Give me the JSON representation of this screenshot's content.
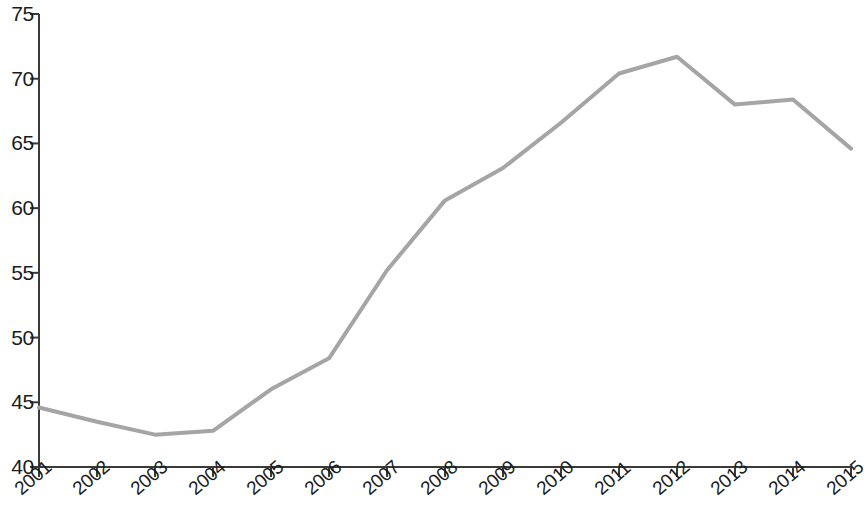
{
  "chart_data": {
    "type": "line",
    "title": "",
    "subtitle": "",
    "xlabel": "",
    "ylabel": "",
    "categories": [
      "2001",
      "2002",
      "2003",
      "2004",
      "2005",
      "2006",
      "2007",
      "2008",
      "2009",
      "2010",
      "2011",
      "2012",
      "2013",
      "2014",
      "2015"
    ],
    "values": [
      44.6,
      43.5,
      42.5,
      42.8,
      46.0,
      48.4,
      55.2,
      60.6,
      63.1,
      66.6,
      70.4,
      71.7,
      68.0,
      68.4,
      64.6
    ],
    "series": [
      {
        "name": "",
        "values": [
          44.6,
          43.5,
          42.5,
          42.8,
          46.0,
          48.4,
          55.2,
          60.6,
          63.1,
          66.6,
          70.4,
          71.7,
          68.0,
          68.4,
          64.6
        ],
        "color": "#a5a5a5"
      }
    ],
    "ylim": [
      40,
      75
    ],
    "yticks": [
      40,
      45,
      50,
      55,
      60,
      65,
      70,
      75
    ],
    "ytick_labels": [
      "40",
      "45",
      "50",
      "55",
      "60",
      "65",
      "70",
      "75"
    ],
    "xtick_labels": [
      "2001",
      "2002",
      "2003",
      "2004",
      "2005",
      "2006",
      "2007",
      "2008",
      "2009",
      "2010",
      "2011",
      "2012",
      "2013",
      "2014",
      "2015"
    ],
    "grid": false,
    "legend": "none",
    "line_color": "#a5a5a5",
    "axis_color": "#3a3a3a",
    "background_color": "#ffffff",
    "markers": false,
    "xtick_rotation_deg": -41
  }
}
